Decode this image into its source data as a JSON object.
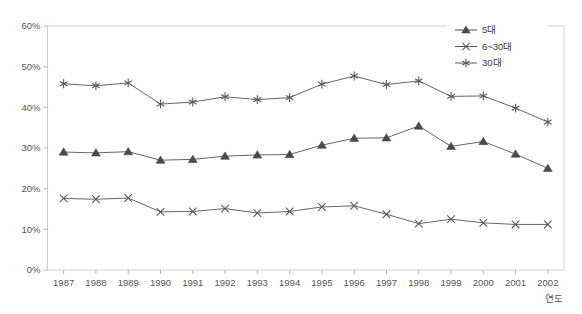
{
  "chart_data": {
    "type": "line",
    "title": "",
    "xlabel": "연도",
    "ylabel": "",
    "categories": [
      "1987",
      "1988",
      "1989",
      "1990",
      "1991",
      "1992",
      "1993",
      "1994",
      "1995",
      "1996",
      "1997",
      "1998",
      "1999",
      "2000",
      "2001",
      "2002"
    ],
    "ylim": [
      0,
      60
    ],
    "ytick_labels": [
      "0%",
      "10%",
      "20%",
      "30%",
      "40%",
      "50%",
      "60%"
    ],
    "ytick_values": [
      0,
      10,
      20,
      30,
      40,
      50,
      60
    ],
    "grid": false,
    "legend_position": "top-right",
    "series": [
      {
        "name": "5대",
        "marker": "triangle",
        "color": "#4a4a4a",
        "values": [
          29.0,
          28.8,
          29.1,
          27.0,
          27.2,
          28.0,
          28.3,
          28.4,
          30.7,
          32.4,
          32.5,
          35.4,
          30.4,
          31.6,
          28.5,
          25.0
        ]
      },
      {
        "name": "6~30대",
        "marker": "x",
        "color": "#5a5a5a",
        "values": [
          17.6,
          17.4,
          17.7,
          14.3,
          14.4,
          15.1,
          14.0,
          14.4,
          15.5,
          15.8,
          13.7,
          11.4,
          12.5,
          11.6,
          11.2,
          11.2
        ]
      },
      {
        "name": "30대",
        "marker": "asterisk",
        "color": "#5a5a5a",
        "values": [
          45.8,
          45.3,
          46.0,
          40.8,
          41.3,
          42.6,
          41.9,
          42.4,
          45.7,
          47.7,
          45.6,
          46.5,
          42.7,
          42.8,
          39.8,
          36.4
        ]
      }
    ]
  },
  "legend": {
    "entries": [
      {
        "label": "5대"
      },
      {
        "label": "6~30대"
      },
      {
        "label": "30대"
      }
    ]
  },
  "axes": {
    "x_title": "연도"
  }
}
